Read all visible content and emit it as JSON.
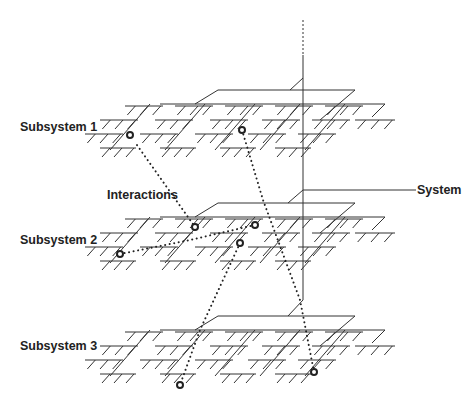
{
  "labels": {
    "subsystem1": "Subsystem 1",
    "subsystem2": "Subsystem 2",
    "subsystem3": "Subsystem 3",
    "interactions": "Interactions",
    "system": "System"
  },
  "colors": {
    "line": "#333333",
    "dots": "#222222",
    "node": "#222222",
    "background": "#ffffff"
  },
  "axis": {
    "x": 303,
    "dashed_top": 20,
    "dashed_bottom": 55,
    "solid_bottom": 300
  },
  "levels": [
    {
      "name": "Subsystem 1",
      "root_y": 90,
      "origin": [
        218,
        90
      ]
    },
    {
      "name": "Subsystem 2",
      "root_y": 203,
      "origin": [
        218,
        203
      ]
    },
    {
      "name": "Subsystem 3",
      "root_y": 316,
      "origin": [
        218,
        316
      ]
    }
  ],
  "system_line": {
    "x1": 303,
    "y1": 190,
    "x2": 416,
    "y2": 190
  },
  "nodes": [
    {
      "level": 1,
      "x": 130,
      "y": 135
    },
    {
      "level": 1,
      "x": 242,
      "y": 130
    },
    {
      "level": 2,
      "x": 195,
      "y": 227
    },
    {
      "level": 2,
      "x": 255,
      "y": 225
    },
    {
      "level": 2,
      "x": 240,
      "y": 243
    },
    {
      "level": 2,
      "x": 120,
      "y": 254
    },
    {
      "level": 3,
      "x": 180,
      "y": 385
    },
    {
      "level": 3,
      "x": 314,
      "y": 372
    }
  ],
  "interactions": [
    [
      [
        137,
        145
      ],
      [
        195,
        227
      ]
    ],
    [
      [
        242,
        130
      ],
      [
        263,
        200
      ],
      [
        300,
        300
      ],
      [
        314,
        372
      ]
    ],
    [
      [
        120,
        254
      ],
      [
        190,
        240
      ],
      [
        255,
        225
      ]
    ],
    [
      [
        240,
        243
      ],
      [
        200,
        330
      ],
      [
        180,
        385
      ]
    ]
  ]
}
